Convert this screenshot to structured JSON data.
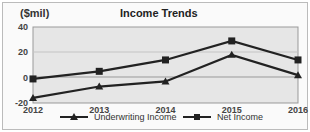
{
  "chart_data": {
    "type": "line",
    "title": "Income Trends",
    "ylabel": "($mil)",
    "xlabel": "",
    "categories": [
      "2012",
      "2013",
      "2014",
      "2015",
      "2016"
    ],
    "series": [
      {
        "name": "Underwriting Income",
        "marker": "triangle",
        "values": [
          -16,
          -7,
          -3,
          18,
          2
        ]
      },
      {
        "name": "Net Income",
        "marker": "square",
        "values": [
          -1,
          5,
          14,
          29,
          14
        ]
      }
    ],
    "ylim": [
      -20,
      40
    ],
    "yticks": [
      "40",
      "20",
      "0",
      "-20"
    ],
    "grid": true,
    "legend_position": "bottom"
  }
}
